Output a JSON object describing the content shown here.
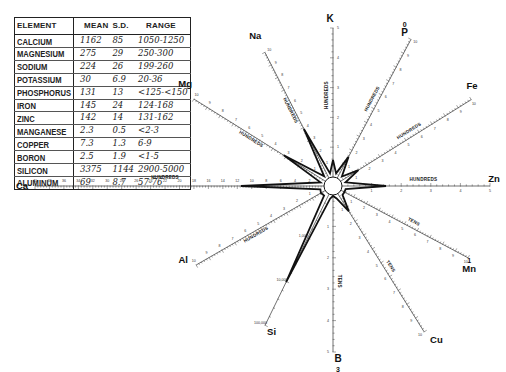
{
  "table": {
    "headers": {
      "element": "ELEMENT",
      "mean": "MEAN",
      "sd": "S.D.",
      "range": "RANGE"
    },
    "rows": [
      {
        "element": "CALCIUM",
        "mean": "1162",
        "sd": "85",
        "range": "1050-1250"
      },
      {
        "element": "MAGNESIUM",
        "mean": "275",
        "sd": "29",
        "range": "250-300"
      },
      {
        "element": "SODIUM",
        "mean": "224",
        "sd": "26",
        "range": "199-260"
      },
      {
        "element": "POTASSIUM",
        "mean": "30",
        "sd": "6.9",
        "range": "20-36"
      },
      {
        "element": "PHOSPHORUS",
        "mean": "131",
        "sd": "13",
        "range": "<125-<150"
      },
      {
        "element": "IRON",
        "mean": "145",
        "sd": "24",
        "range": "124-168"
      },
      {
        "element": "ZINC",
        "mean": "142",
        "sd": "14",
        "range": "131-162"
      },
      {
        "element": "MANGANESE",
        "mean": "2.3",
        "sd": "0.5",
        "range": "<2-3"
      },
      {
        "element": "COPPER",
        "mean": "7.3",
        "sd": "1.3",
        "range": "6-9"
      },
      {
        "element": "BORON",
        "mean": "2.5",
        "sd": "1.9",
        "range": "<1-5"
      },
      {
        "element": "SILICON",
        "mean": "3375",
        "sd": "1144",
        "range": "2900-5000"
      },
      {
        "element": "ALUMINUM",
        "mean": "69",
        "sd": "8.7",
        "range": "57-76"
      }
    ]
  },
  "chart_data": {
    "type": "radar",
    "title": "",
    "center": [
      333,
      186
    ],
    "axes": [
      {
        "id": "K",
        "label": "K",
        "angle": -90,
        "length": 158,
        "unit": "HUNDREDS",
        "ticks": [
          "1",
          "2",
          "3",
          "4",
          "5"
        ],
        "label_extra": ""
      },
      {
        "id": "P",
        "label": "P",
        "angle": -62,
        "length": 166,
        "unit": "HUNDREDS",
        "ticks": [
          "1",
          "2",
          "3",
          "4",
          "5",
          "6",
          "7",
          "8",
          "9",
          "10"
        ],
        "label_extra": "0"
      },
      {
        "id": "Fe",
        "label": "Fe",
        "angle": -32,
        "length": 163,
        "unit": "HUNDREDS",
        "ticks": [
          "1",
          "2",
          "3",
          "4",
          "5",
          "6",
          "7",
          "8",
          "9",
          "10"
        ],
        "label_extra": ""
      },
      {
        "id": "Zn",
        "label": "Zn",
        "angle": 0,
        "length": 157,
        "unit": "HUNDREDS",
        "ticks": [
          "1",
          "2",
          "3",
          "4",
          "5"
        ],
        "label_extra": ""
      },
      {
        "id": "Mn",
        "label": "Mn",
        "angle": 28,
        "length": 153,
        "unit": "TENS",
        "ticks": [
          "1",
          "2",
          "3",
          "4",
          "5",
          "6",
          "7",
          "8",
          "9",
          "10"
        ],
        "label_extra": "1"
      },
      {
        "id": "Cu",
        "label": "Cu",
        "angle": 58,
        "length": 172,
        "unit": "TENS",
        "ticks": [
          "1",
          "2",
          "3",
          "4",
          "5",
          "6",
          "7",
          "8",
          "9",
          "10"
        ],
        "label_extra": ""
      },
      {
        "id": "B",
        "label": "B",
        "angle": 90,
        "length": 166,
        "unit": "TENS",
        "ticks": [
          "1",
          "2",
          "3",
          "4",
          "5"
        ],
        "label_extra": "3"
      },
      {
        "id": "Si",
        "label": "Si",
        "angle": 116,
        "length": 155,
        "unit": "",
        "ticks": [
          "1,000",
          "10,000",
          "100,000"
        ],
        "label_extra": ""
      },
      {
        "id": "Al",
        "label": "Al",
        "angle": 150,
        "length": 158,
        "unit": "HUNDREDS",
        "ticks": [
          "1",
          "2",
          "3",
          "4",
          "5",
          "6",
          "7",
          "8",
          "9",
          "10"
        ],
        "label_extra": ""
      },
      {
        "id": "Ca",
        "label": "Ca",
        "angle": 180,
        "length": 298,
        "unit": "HUNDREDS",
        "ticks": [
          "2",
          "4",
          "6",
          "8",
          "10",
          "12",
          "14",
          "16",
          "18",
          "20",
          "22",
          "24",
          "26",
          "28",
          "30",
          "32",
          "34",
          "36",
          "38",
          "40"
        ],
        "label_extra": ""
      },
      {
        "id": "Mg",
        "label": "Mg",
        "angle": -148,
        "length": 164,
        "unit": "HUNDREDS",
        "ticks": [
          "1",
          "2",
          "3",
          "4",
          "5",
          "6",
          "7",
          "8",
          "9",
          "10"
        ],
        "label_extra": ""
      },
      {
        "id": "Na",
        "label": "Na",
        "angle": -117,
        "length": 150,
        "unit": "HUNDREDS",
        "ticks": [
          "1",
          "2",
          "3",
          "4",
          "5",
          "6",
          "7",
          "8",
          "9",
          "10"
        ],
        "label_extra": ""
      }
    ],
    "profile_radii": [
      26,
      33,
      30,
      53,
      13,
      30,
      10,
      107,
      14,
      92,
      58,
      64
    ],
    "center_radius": 9
  }
}
